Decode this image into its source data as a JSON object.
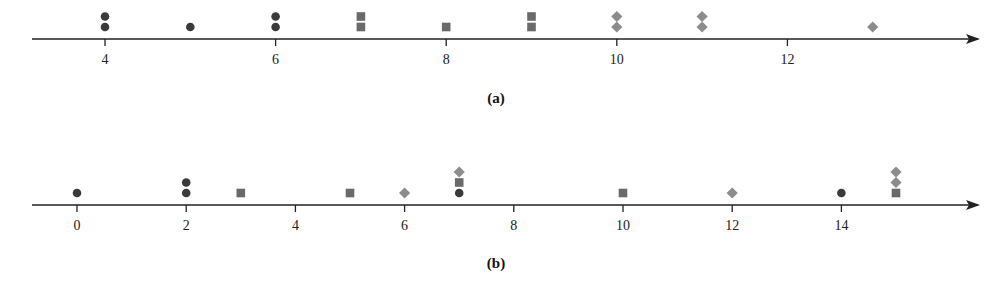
{
  "chart_data": [
    {
      "type": "scatter",
      "subtype": "dot-plot",
      "panel_label": "(a)",
      "axis": {
        "min_tick": 4,
        "max_tick": 12,
        "tick_step": 2,
        "ticks": [
          4,
          6,
          8,
          10,
          12
        ],
        "arrow": true
      },
      "xlim": [
        3.15,
        14.3
      ],
      "series": [
        {
          "name": "circle",
          "marker": "circle",
          "color": "#3a3a3a",
          "values": [
            4,
            4,
            5,
            6,
            6
          ]
        },
        {
          "name": "square",
          "marker": "square",
          "color": "#6a6a6a",
          "values": [
            7,
            7,
            8,
            9,
            9
          ]
        },
        {
          "name": "diamond",
          "marker": "diamond",
          "color": "#8c8c8c",
          "values": [
            10,
            10,
            11,
            11,
            13
          ]
        }
      ],
      "grid": false,
      "legend": null
    },
    {
      "type": "scatter",
      "subtype": "dot-plot",
      "panel_label": "(b)",
      "axis": {
        "min_tick": 0,
        "max_tick": 14,
        "tick_step": 2,
        "ticks": [
          0,
          2,
          4,
          6,
          8,
          10,
          12,
          14
        ],
        "arrow": true
      },
      "xlim": [
        -0.8,
        16.5
      ],
      "series": [
        {
          "name": "circle",
          "marker": "circle",
          "color": "#3a3a3a",
          "values": [
            0,
            2,
            2,
            7,
            14
          ]
        },
        {
          "name": "square",
          "marker": "square",
          "color": "#6a6a6a",
          "values": [
            3,
            5,
            7,
            10,
            15
          ]
        },
        {
          "name": "diamond",
          "marker": "diamond",
          "color": "#8c8c8c",
          "values": [
            6,
            7,
            12,
            15,
            15
          ]
        }
      ],
      "stacks": [
        {
          "x": 0,
          "markers": [
            "circle"
          ]
        },
        {
          "x": 2,
          "markers": [
            "circle",
            "circle"
          ]
        },
        {
          "x": 3,
          "markers": [
            "square"
          ]
        },
        {
          "x": 5,
          "markers": [
            "square"
          ]
        },
        {
          "x": 6,
          "markers": [
            "diamond"
          ]
        },
        {
          "x": 7,
          "markers": [
            "circle",
            "square",
            "diamond"
          ]
        },
        {
          "x": 10,
          "markers": [
            "square"
          ]
        },
        {
          "x": 12,
          "markers": [
            "diamond"
          ]
        },
        {
          "x": 14,
          "markers": [
            "circle"
          ]
        },
        {
          "x": 15,
          "markers": [
            "square",
            "diamond",
            "diamond"
          ]
        }
      ],
      "grid": false,
      "legend": null
    }
  ],
  "panels": {
    "a": {
      "label": "(a)",
      "ticks": [
        "4",
        "6",
        "8",
        "10",
        "12"
      ],
      "stacks": [
        {
          "x": 4,
          "markers": [
            "circle",
            "circle"
          ]
        },
        {
          "x": 5,
          "markers": [
            "circle"
          ]
        },
        {
          "x": 6,
          "markers": [
            "circle",
            "circle"
          ]
        },
        {
          "x": 7,
          "markers": [
            "square",
            "square"
          ]
        },
        {
          "x": 8,
          "markers": [
            "square"
          ]
        },
        {
          "x": 9,
          "markers": [
            "square",
            "square"
          ]
        },
        {
          "x": 10,
          "markers": [
            "diamond",
            "diamond"
          ]
        },
        {
          "x": 11,
          "markers": [
            "diamond",
            "diamond"
          ]
        },
        {
          "x": 13,
          "markers": [
            "diamond"
          ]
        }
      ]
    },
    "b": {
      "label": "(b)",
      "ticks": [
        "0",
        "2",
        "4",
        "6",
        "8",
        "10",
        "12",
        "14"
      ]
    }
  },
  "colors": {
    "circle": "#3a3a3a",
    "square": "#6a6a6a",
    "diamond": "#8c8c8c",
    "axis": "#222222"
  }
}
